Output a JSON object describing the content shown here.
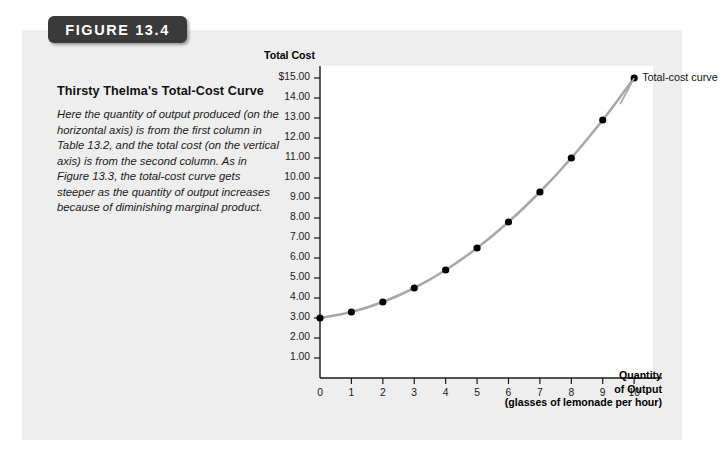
{
  "figure": {
    "tab_label": "FIGURE 13.4",
    "title": "Thirsty Thelma's Total-Cost Curve",
    "caption": "Here the quantity of output produced (on the horizontal axis) is from the first column in Table 13.2, and the total cost (on the vertical axis) is from the second column. As in Figure 13.3, the total-cost curve gets steeper as the quantity of output increases because of diminishing marginal product."
  },
  "colors": {
    "panel_background": "#eeeeee",
    "plot_background": "#ffffff",
    "curve": "#a8a8a8",
    "point": "#000000",
    "axis": "#1a1a1a",
    "tab_background": "#3a3a3a"
  },
  "chart_data": {
    "type": "line",
    "title": "Thirsty Thelma's Total-Cost Curve",
    "series_label": "Total-cost curve",
    "ylabel": "Total Cost",
    "xlabel": "Quantity of Output",
    "xlabel_line2": "of Output",
    "xlabel_units": "(glasses of lemonade per hour)",
    "xlabel_line1": "Quantity",
    "x": [
      0,
      1,
      2,
      3,
      4,
      5,
      6,
      7,
      8,
      9,
      10
    ],
    "values": [
      3.0,
      3.3,
      3.8,
      4.5,
      5.4,
      6.5,
      7.8,
      9.3,
      11.0,
      12.9,
      15.0
    ],
    "xlim": [
      0,
      10.6
    ],
    "ylim": [
      0,
      15.6
    ],
    "grid": false,
    "legend_position": "point-label-top-right",
    "x_tick_labels": [
      "0",
      "1",
      "2",
      "3",
      "4",
      "5",
      "6",
      "7",
      "8",
      "9",
      "10"
    ],
    "y_tick_labels": [
      "1.00",
      "2.00",
      "3.00",
      "4.00",
      "5.00",
      "6.00",
      "7.00",
      "8.00",
      "9.00",
      "10.00",
      "11.00",
      "12.00",
      "13.00",
      "14.00",
      "$15.00"
    ],
    "y_tick_values": [
      1,
      2,
      3,
      4,
      5,
      6,
      7,
      8,
      9,
      10,
      11,
      12,
      13,
      14,
      15
    ]
  }
}
